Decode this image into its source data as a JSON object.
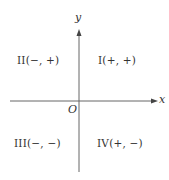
{
  "axes": {
    "x_label": "x",
    "y_label": "y",
    "origin_label": "O",
    "color": "#666666"
  },
  "quadrants": {
    "I": "I(+, +)",
    "II": "II(−, +)",
    "III": "III(−, −)",
    "IV": "IV(+, −)"
  }
}
